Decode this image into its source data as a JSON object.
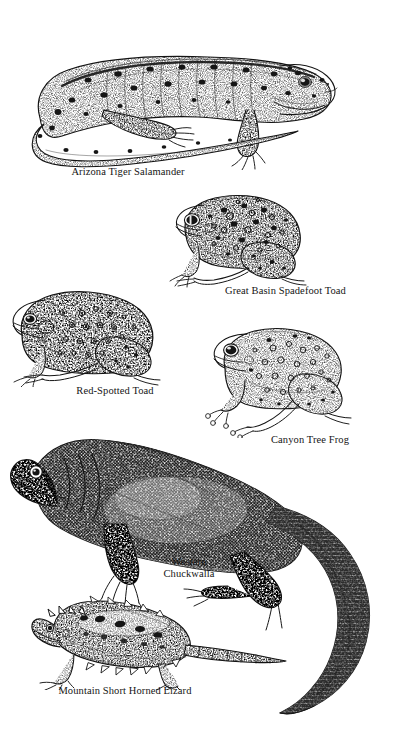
{
  "plate": {
    "kind": "natural-history-illustration-plate",
    "subject": "Southwestern desert amphibians and reptiles",
    "background_color": "#ffffff",
    "ink_color": "#151515",
    "style": "stippled pen-and-ink line engraving",
    "width": 405,
    "height": 748
  },
  "figures": [
    {
      "id": "salamander",
      "caption": "Arizona Tiger Salamander",
      "group": "amphibian",
      "pose": "full lateral view, body curved with tail sweeping left beneath, head facing right",
      "markings": "dark blotches scattered over a pale stippled body, dark dorsal ridge line"
    },
    {
      "id": "spadefoot",
      "caption": "Great Basin Spadefoot Toad",
      "group": "amphibian",
      "pose": "three-quarter lateral, sitting, head facing left",
      "markings": "heavy dark spots and rings over granular stippled skin, large round eye"
    },
    {
      "id": "redspot",
      "caption": "Red-Spotted Toad",
      "group": "amphibian",
      "pose": "lateral sitting posture, head facing left",
      "markings": "small round wart spots in rings, smooth flanks, prominent parotoid gland"
    },
    {
      "id": "treefrog",
      "caption": "Canyon Tree Frog",
      "group": "amphibian",
      "pose": "lateral sitting posture, head facing left, toe pads visible",
      "markings": "mottled stipple with pale circular blotches, large dark eye"
    },
    {
      "id": "chuckwalla",
      "caption": "Western\nChuckwalla",
      "caption_lines": [
        "Western",
        "Chuckwalla"
      ],
      "group": "reptile",
      "pose": "full lateral view, head at left, long tail curving down and around to lower right",
      "markings": "dense dark scalation, heavy folds at the neck, banded scaly tail"
    },
    {
      "id": "hornlizard",
      "caption": "Mountain Short Horned Lizard",
      "group": "reptile",
      "pose": "lateral view, head at left, flattened broad body, short tapering tail to right",
      "markings": "rows of pointed fringe scales along the flanks, paired dark dorsal blotches, short occipital horns"
    }
  ]
}
